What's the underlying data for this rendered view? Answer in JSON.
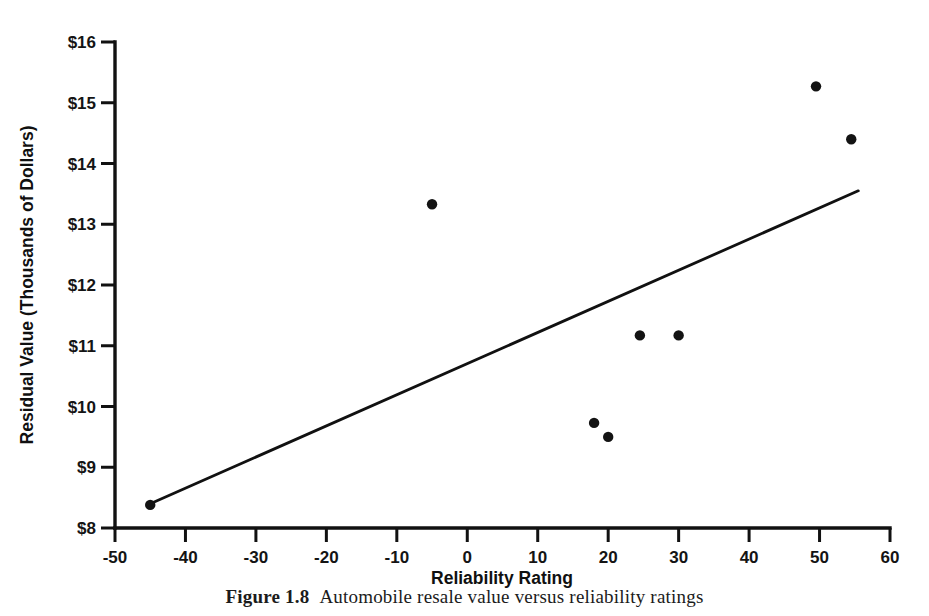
{
  "figure": {
    "caption_label": "Figure 1.8",
    "caption_text": "Automobile resale value versus reliability ratings",
    "background_color": "#ffffff",
    "ink_color": "#111111"
  },
  "chart_data": {
    "type": "scatter",
    "title": "",
    "subtitle": "",
    "xlabel": "Reliability Rating",
    "ylabel": "Residual Value (Thousands of Dollars)",
    "xlim": [
      -50,
      60
    ],
    "ylim": [
      8,
      16
    ],
    "xticks": [
      -50,
      -40,
      -30,
      -20,
      -10,
      0,
      10,
      20,
      30,
      40,
      50,
      60
    ],
    "xtick_labels": [
      "-50",
      "-40",
      "-30",
      "-20",
      "-10",
      "0",
      "10",
      "20",
      "30",
      "40",
      "50",
      "60"
    ],
    "yticks": [
      8,
      9,
      10,
      11,
      12,
      13,
      14,
      15,
      16
    ],
    "ytick_labels": [
      "$8",
      "$9",
      "$10",
      "$11",
      "$12",
      "$13",
      "$14",
      "$15",
      "$16"
    ],
    "grid": false,
    "legend": false,
    "legend_position": "none",
    "marker_color": "#131313",
    "marker_size": 5.2,
    "points": [
      {
        "x": -45,
        "y": 8.38
      },
      {
        "x": -5,
        "y": 13.33
      },
      {
        "x": 18,
        "y": 9.73
      },
      {
        "x": 20,
        "y": 9.5
      },
      {
        "x": 24.5,
        "y": 11.17
      },
      {
        "x": 30,
        "y": 11.17
      },
      {
        "x": 49.5,
        "y": 15.27
      },
      {
        "x": 54.5,
        "y": 14.4
      }
    ],
    "trendline": {
      "type": "linear",
      "color": "#111111",
      "x_start": -45,
      "y_start": 8.4,
      "x_end": 55.5,
      "y_end": 13.55
    }
  }
}
